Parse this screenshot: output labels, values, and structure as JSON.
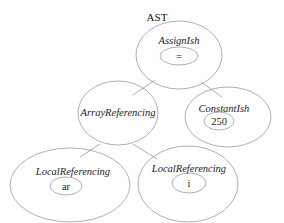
{
  "title": "AST",
  "nodes": [
    {
      "id": "assign",
      "type": "AssignIsh",
      "value": "="
    },
    {
      "id": "array",
      "type": "ArrayReferencing",
      "value": ""
    },
    {
      "id": "const",
      "type": "ConstantIsh",
      "value": "250"
    },
    {
      "id": "local_ar",
      "type": "LocalReferencing",
      "value": "ar"
    },
    {
      "id": "local_i",
      "type": "LocalReferencing",
      "value": "i"
    }
  ],
  "edges": [
    {
      "from": "assign",
      "to": "array"
    },
    {
      "from": "assign",
      "to": "const"
    },
    {
      "from": "array",
      "to": "local_ar"
    },
    {
      "from": "array",
      "to": "local_i"
    }
  ],
  "colors": {
    "stroke": "#9a9a9a",
    "text": "#222222",
    "background": "#ffffff"
  }
}
